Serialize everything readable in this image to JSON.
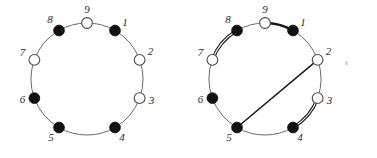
{
  "figure": {
    "background_color": "#ffffff",
    "width": 377,
    "height": 158,
    "colors": {
      "filled_vertex": "#111111",
      "open_vertex": "#ffffff",
      "vertex_stroke": "#4a4a4a",
      "thin_edge": "#6b6b6b",
      "bold_edge": "#1a1a1a",
      "label": "#2b2b2b",
      "speck": "#d8d8d8"
    },
    "vertex_radius": 5.4,
    "label_font_size": 11
  },
  "diagrams": [
    {
      "id": "left-diagram",
      "name": "left-cycle-diagram",
      "center_x": 87,
      "center_y": 79,
      "radius": 56,
      "vertices": [
        {
          "label": "1",
          "angle_deg": 60,
          "fill": "filled",
          "label_dx": 10,
          "label_dy": -7
        },
        {
          "label": "2",
          "angle_deg": 20,
          "fill": "open",
          "label_dx": 11,
          "label_dy": -7
        },
        {
          "label": "3",
          "angle_deg": -20,
          "fill": "open",
          "label_dx": 12,
          "label_dy": 3
        },
        {
          "label": "4",
          "angle_deg": -60,
          "fill": "filled",
          "label_dx": 7,
          "label_dy": 11
        },
        {
          "label": "5",
          "angle_deg": -120,
          "fill": "filled",
          "label_dx": -8,
          "label_dy": 11
        },
        {
          "label": "6",
          "angle_deg": 200,
          "fill": "filled",
          "label_dx": -12,
          "label_dy": 2
        },
        {
          "label": "7",
          "angle_deg": 160,
          "fill": "open",
          "label_dx": -12,
          "label_dy": -6
        },
        {
          "label": "8",
          "angle_deg": 120,
          "fill": "filled",
          "label_dx": -9,
          "label_dy": -10
        },
        {
          "label": "9",
          "angle_deg": 90,
          "fill": "open",
          "label_dx": 0,
          "label_dy": -13
        }
      ],
      "edges": [
        {
          "from": "1",
          "to": "2",
          "style": "thin"
        },
        {
          "from": "2",
          "to": "3",
          "style": "thin"
        },
        {
          "from": "3",
          "to": "4",
          "style": "thin"
        },
        {
          "from": "4",
          "to": "5",
          "style": "thin"
        },
        {
          "from": "5",
          "to": "6",
          "style": "thin"
        },
        {
          "from": "6",
          "to": "7",
          "style": "thin"
        },
        {
          "from": "7",
          "to": "8",
          "style": "thin"
        },
        {
          "from": "8",
          "to": "9",
          "style": "thin"
        },
        {
          "from": "9",
          "to": "1",
          "style": "thin"
        }
      ],
      "chords": []
    },
    {
      "id": "right-diagram",
      "name": "right-cycle-diagram",
      "center_x": 265,
      "center_y": 79,
      "radius": 56,
      "vertices": [
        {
          "label": "1",
          "angle_deg": 60,
          "fill": "filled",
          "label_dx": 10,
          "label_dy": -7
        },
        {
          "label": "2",
          "angle_deg": 20,
          "fill": "open",
          "label_dx": 11,
          "label_dy": -7
        },
        {
          "label": "3",
          "angle_deg": -20,
          "fill": "open",
          "label_dx": 12,
          "label_dy": 3
        },
        {
          "label": "4",
          "angle_deg": -60,
          "fill": "filled",
          "label_dx": 7,
          "label_dy": 11
        },
        {
          "label": "5",
          "angle_deg": -120,
          "fill": "filled",
          "label_dx": -8,
          "label_dy": 11
        },
        {
          "label": "6",
          "angle_deg": 200,
          "fill": "filled",
          "label_dx": -12,
          "label_dy": 2
        },
        {
          "label": "7",
          "angle_deg": 160,
          "fill": "open",
          "label_dx": -12,
          "label_dy": -6
        },
        {
          "label": "8",
          "angle_deg": 120,
          "fill": "filled",
          "label_dx": -9,
          "label_dy": -10
        },
        {
          "label": "9",
          "angle_deg": 90,
          "fill": "open",
          "label_dx": 0,
          "label_dy": -13
        }
      ],
      "edges": [
        {
          "from": "1",
          "to": "2",
          "style": "thin"
        },
        {
          "from": "2",
          "to": "3",
          "style": "thin"
        },
        {
          "from": "3",
          "to": "4",
          "style": "double"
        },
        {
          "from": "4",
          "to": "5",
          "style": "thin"
        },
        {
          "from": "5",
          "to": "6",
          "style": "thin"
        },
        {
          "from": "6",
          "to": "7",
          "style": "thin"
        },
        {
          "from": "7",
          "to": "8",
          "style": "double"
        },
        {
          "from": "8",
          "to": "9",
          "style": "thin"
        },
        {
          "from": "9",
          "to": "1",
          "style": "bold"
        }
      ],
      "chords": [
        {
          "from": "2",
          "to": "5",
          "style": "chord"
        }
      ]
    }
  ],
  "artifacts": [
    {
      "name": "speck",
      "x": 345,
      "y": 61,
      "w": 3,
      "h": 4
    }
  ]
}
